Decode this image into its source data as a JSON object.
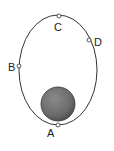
{
  "diagram": {
    "type": "elliptical-orbit",
    "colors": {
      "orbit": "#333333",
      "planet": "#707070",
      "background": "#ffffff"
    },
    "points": [
      {
        "label": "A",
        "position": "periapsis"
      },
      {
        "label": "B",
        "position": "left side"
      },
      {
        "label": "C",
        "position": "apoapsis"
      },
      {
        "label": "D",
        "position": "upper right"
      }
    ]
  }
}
